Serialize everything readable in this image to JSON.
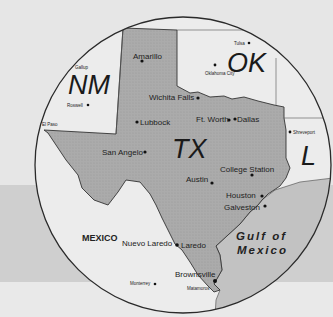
{
  "map": {
    "colors": {
      "background": "#e6e6e6",
      "band": "#cfcfcf",
      "circle_fill": "#ececec",
      "texas_fill": "#a9a9a9",
      "gulf_fill": "#c4c4c4",
      "border": "#333333"
    },
    "states": {
      "tx": "TX",
      "nm": "NM",
      "ok": "OK",
      "la": "L"
    },
    "countries": {
      "mexico": "MEXICO"
    },
    "water": {
      "gulf_line1": "Gulf of",
      "gulf_line2": "Mexico"
    },
    "cities": {
      "amarillo": "Amarillo",
      "lubbock": "Lubbock",
      "wichita_falls": "Wichita Falls",
      "fort_worth": "Ft. Worth",
      "dallas": "Dallas",
      "san_angelo": "San Angelo",
      "austin": "Austin",
      "college_station": "College Station",
      "houston": "Houston",
      "galveston": "Galveston",
      "nuevo_laredo": "Nuevo Laredo",
      "laredo": "Laredo",
      "brownsville": "Brownsville",
      "monterrey": "Monterrey",
      "matamoros": "Matamoros",
      "el_paso": "El Paso",
      "roswell": "Roswell",
      "gallup": "Gallup",
      "tulsa": "Tulsa",
      "oklahoma_city": "Oklahoma City",
      "shreveport": "Shreveport"
    }
  }
}
